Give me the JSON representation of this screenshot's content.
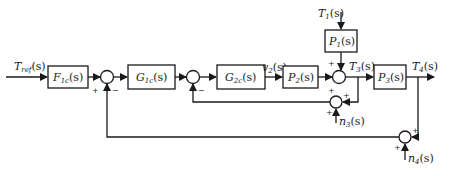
{
  "diagram": {
    "type": "block-diagram",
    "blocks": {
      "F1c": {
        "label": "F",
        "sub": "1c",
        "arg": "(s)"
      },
      "G1c": {
        "label": "G",
        "sub": "1c",
        "arg": "(s)"
      },
      "G2c": {
        "label": "G",
        "sub": "2c",
        "arg": "(s)"
      },
      "P2": {
        "label": "P",
        "sub": "2",
        "arg": "(s)"
      },
      "P1": {
        "label": "P",
        "sub": "1",
        "arg": "(s)"
      },
      "P3": {
        "label": "P",
        "sub": "3",
        "arg": "(s)"
      }
    },
    "signals": {
      "Tref": {
        "label": "T",
        "sub": "ref",
        "arg": "(s)"
      },
      "v2": {
        "label": "v",
        "sub": "2",
        "arg": "(s)"
      },
      "T1": {
        "label": "T",
        "sub": "1",
        "arg": "(s)"
      },
      "T3": {
        "label": "T",
        "sub": "3",
        "arg": "(s)"
      },
      "T4": {
        "label": "T",
        "sub": "4",
        "arg": "(s)"
      },
      "n3": {
        "label": "n",
        "sub": "3",
        "arg": "(s)"
      },
      "n4": {
        "label": "n",
        "sub": "4",
        "arg": "(s)"
      }
    },
    "summing_junctions": {
      "s1": {
        "signs": [
          "+",
          "−"
        ]
      },
      "s2": {
        "signs": [
          "−"
        ]
      },
      "s3": {
        "signs": [
          "+",
          "+"
        ]
      },
      "s_n3": {
        "signs": [
          "+",
          "+"
        ]
      },
      "s_n4": {
        "signs": [
          "+",
          "+"
        ]
      }
    }
  }
}
